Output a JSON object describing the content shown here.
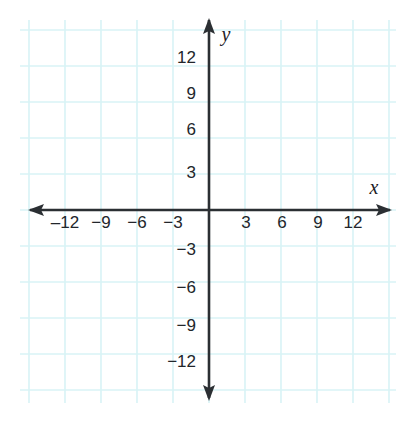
{
  "chart_data": {
    "type": "scatter",
    "title": "",
    "subtitle": "",
    "xlabel": "x",
    "ylabel": "y",
    "xlim": [
      -15,
      15
    ],
    "ylim": [
      -15,
      15
    ],
    "grid": true,
    "grid_step": 3,
    "legend": "none",
    "series": [],
    "x_tick_labels": [
      "‒12",
      "−9",
      "−6",
      "−3",
      "3",
      "6",
      "9",
      "12"
    ],
    "x_tick_values": [
      -12,
      -9,
      -6,
      -3,
      3,
      6,
      9,
      12
    ],
    "y_tick_labels": [
      "12",
      "9",
      "6",
      "3",
      "−3",
      "−6",
      "−9",
      "−12"
    ],
    "y_tick_values": [
      12,
      9,
      6,
      3,
      -3,
      -6,
      -9,
      -12
    ],
    "annotations": []
  },
  "colors": {
    "grid": "#d8f3f6",
    "grid_minor": "#e9fafc",
    "axis": "#2b2f33",
    "label": "#22262b",
    "background": "#ffffff"
  },
  "axes": {
    "x_axis_name": "x",
    "y_axis_name": "y",
    "x_axis_arrow_left": "arrow-left",
    "x_axis_arrow_right": "arrow-right",
    "y_axis_arrow_up": "arrow-up",
    "y_axis_arrow_down": "arrow-down"
  },
  "ticks": {
    "x": [
      {
        "label": "‒12",
        "value": -12,
        "px": 65,
        "py": 228
      },
      {
        "label": "−9",
        "value": -9,
        "px": 101,
        "py": 228
      },
      {
        "label": "−6",
        "value": -6,
        "px": 137,
        "py": 228
      },
      {
        "label": "−3",
        "value": -3,
        "px": 173,
        "py": 228
      },
      {
        "label": "3",
        "value": 3,
        "px": 246,
        "py": 228
      },
      {
        "label": "6",
        "value": 6,
        "px": 282,
        "py": 228
      },
      {
        "label": "9",
        "value": 9,
        "px": 318,
        "py": 228
      },
      {
        "label": "12",
        "value": 12,
        "px": 353,
        "py": 228
      }
    ],
    "y": [
      {
        "label": "12",
        "value": 12,
        "px": 196,
        "py": 63
      },
      {
        "label": "9",
        "value": 9,
        "px": 196,
        "py": 99
      },
      {
        "label": "6",
        "value": 6,
        "px": 196,
        "py": 135
      },
      {
        "label": "3",
        "value": 3,
        "px": 196,
        "py": 178
      },
      {
        "label": "−3",
        "value": -3,
        "px": 196,
        "py": 255
      },
      {
        "label": "−6",
        "value": -6,
        "px": 196,
        "py": 293
      },
      {
        "label": "−9",
        "value": -9,
        "px": 196,
        "py": 331
      },
      {
        "label": "−12",
        "value": -12,
        "px": 196,
        "py": 367
      }
    ]
  }
}
